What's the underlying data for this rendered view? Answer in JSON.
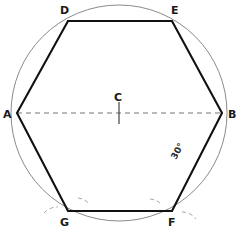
{
  "figure": {
    "width": 244,
    "height": 233,
    "background": "#ffffff",
    "stroke_color_hexagon": "#111111",
    "stroke_color_circle": "#8a8a8a",
    "stroke_color_dashed": "#777777",
    "stroke_color_arc_marks": "#9a9a9a",
    "label_color": "#1a1a1a"
  },
  "circle": {
    "name": "circumscribed-circle",
    "center_x": 119,
    "center_y": 113,
    "radius": 108
  },
  "center_point": {
    "label": "C",
    "x": 119,
    "y": 113,
    "label_x": 114,
    "label_y": 101,
    "tick_length": 22
  },
  "diameter": {
    "name": "diameter-AB",
    "from": "A",
    "to": "B",
    "style": "dashed",
    "x1": 17,
    "y1": 113,
    "x2": 222,
    "y2": 113
  },
  "vertices": [
    {
      "label": "A",
      "x": 17,
      "y": 113,
      "label_x": 3,
      "label_y": 118
    },
    {
      "label": "D",
      "x": 68,
      "y": 21,
      "label_x": 60,
      "label_y": 14
    },
    {
      "label": "E",
      "x": 172,
      "y": 21,
      "label_x": 171,
      "label_y": 14
    },
    {
      "label": "B",
      "x": 222,
      "y": 113,
      "label_x": 228,
      "label_y": 118
    },
    {
      "label": "F",
      "x": 172,
      "y": 211,
      "label_x": 168,
      "label_y": 226
    },
    {
      "label": "G",
      "x": 68,
      "y": 211,
      "label_x": 60,
      "label_y": 226
    }
  ],
  "hexagon": {
    "name": "hexagon-ADEBFG",
    "points": "17,113 68,21 172,21 222,113 172,211 68,211",
    "vertex_order": [
      "A",
      "D",
      "E",
      "B",
      "F",
      "G"
    ]
  },
  "annotation": {
    "text": "30°",
    "x": 176,
    "y": 160,
    "rotation": -62
  },
  "arc_marks": [
    {
      "name": "arc-mark-g-upper-right",
      "d": "M 78 198 A 18 18 0 0 1 90 205"
    },
    {
      "name": "arc-mark-g-lower-left",
      "d": "M 44 213 A 18 18 0 0 1 58 207"
    },
    {
      "name": "arc-mark-f-upper-left",
      "d": "M 150 199 A 18 18 0 0 1 162 205"
    },
    {
      "name": "arc-mark-f-lower-right",
      "d": "M 182 212 A 18 18 0 0 1 196 219"
    }
  ],
  "caption": {
    "text": ""
  }
}
